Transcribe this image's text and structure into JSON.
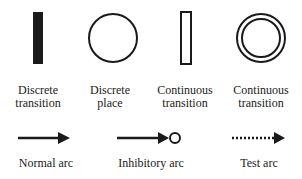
{
  "legend": {
    "symbols": [
      {
        "id": "discrete-transition",
        "line1": "Discrete",
        "line2": "transition"
      },
      {
        "id": "discrete-place",
        "line1": "Discrete",
        "line2": "place"
      },
      {
        "id": "continuous-transition",
        "line1": "Continuous",
        "line2": "transition"
      },
      {
        "id": "continuous-place",
        "line1": "Continuous",
        "line2": "transition"
      }
    ],
    "arcs": [
      {
        "id": "normal-arc",
        "label": "Normal arc"
      },
      {
        "id": "inhibitory-arc",
        "label": "Inhibitory arc"
      },
      {
        "id": "test-arc",
        "label": "Test arc"
      }
    ]
  },
  "colors": {
    "stroke": "#1a1a1a",
    "background": "#ffffff"
  }
}
